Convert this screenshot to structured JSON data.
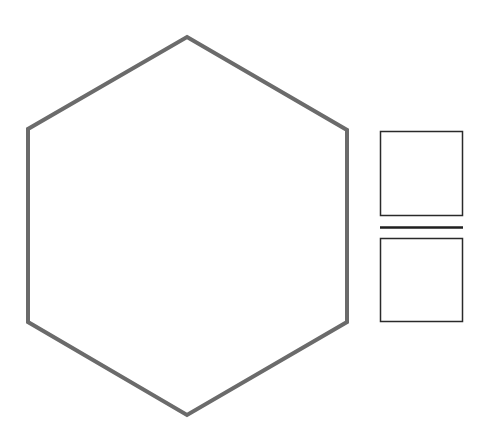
{
  "diagram": {
    "background": "#ffffff",
    "hexagon": {
      "points": "187,37 347,130 347,322 187,415 28,322 28,129",
      "stroke": "#6b6b6b",
      "stroke_width": 4,
      "fill": "none"
    },
    "squares": [
      {
        "x": 380.5,
        "y": 131.5,
        "width": 82,
        "height": 84,
        "stroke": "#2a2a2a",
        "stroke_width": 1.5
      },
      {
        "x": 380.5,
        "y": 238.5,
        "width": 82,
        "height": 83,
        "stroke": "#2a2a2a",
        "stroke_width": 1.5
      }
    ],
    "separator": {
      "x1": 380,
      "y1": 227.5,
      "x2": 463,
      "y2": 227.5,
      "stroke": "#1f1f1f",
      "stroke_width": 2.5
    }
  }
}
